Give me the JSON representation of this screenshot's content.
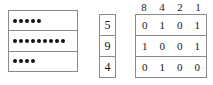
{
  "diagram": {
    "kind": "place-value-binary-conversion",
    "dot_panel": {
      "rows": [
        {
          "label": "5",
          "dot_count": 5
        },
        {
          "label": "9",
          "dot_count": 9
        },
        {
          "label": "4",
          "dot_count": 4
        }
      ],
      "dot_color": "#141414",
      "border_color": "#8a8a8a"
    },
    "numeral_column": {
      "values": [
        "5",
        "9",
        "4"
      ]
    },
    "binary_table": {
      "headers": [
        "8",
        "4",
        "2",
        "1"
      ],
      "rows": [
        [
          "0",
          "1",
          "0",
          "1"
        ],
        [
          "1",
          "0",
          "0",
          "1"
        ],
        [
          "0",
          "1",
          "0",
          "0"
        ]
      ]
    }
  },
  "chart_data": {
    "type": "table",
    "title": "",
    "categories": [
      "5",
      "9",
      "4"
    ],
    "columns": [
      "8",
      "4",
      "2",
      "1"
    ],
    "values": [
      [
        0,
        1,
        0,
        1
      ],
      [
        1,
        0,
        0,
        1
      ],
      [
        0,
        1,
        0,
        0
      ]
    ],
    "dot_counts": [
      5,
      9,
      4
    ]
  }
}
